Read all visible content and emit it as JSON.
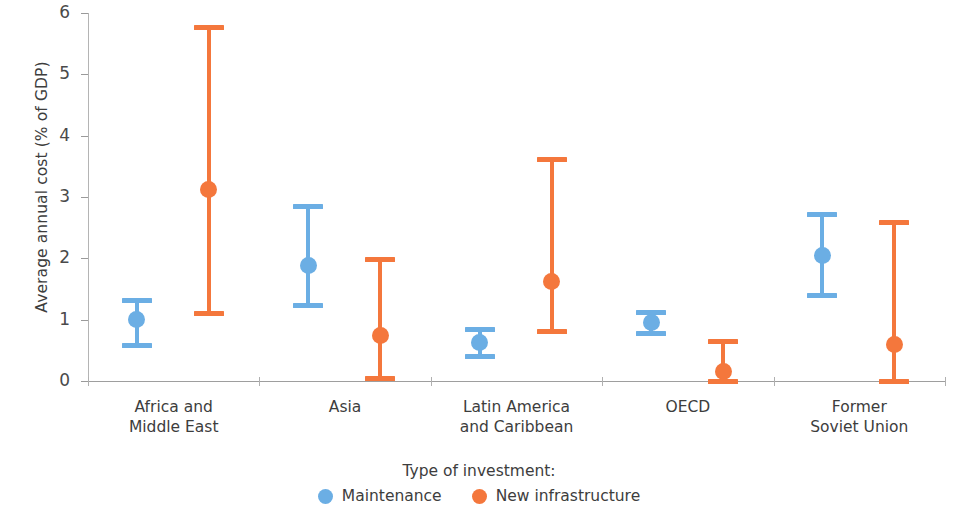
{
  "chart_data": {
    "type": "scatter",
    "title": "",
    "xlabel": "",
    "ylabel": "Average annual cost (% of GDP)",
    "ylim": [
      0,
      6
    ],
    "yticks": [
      0,
      1,
      2,
      3,
      4,
      5,
      6
    ],
    "ytick_labels": [
      "0",
      "1",
      "2",
      "3",
      "4",
      "5",
      "6"
    ],
    "grid": false,
    "legend_position": "bottom",
    "legend_title": "Type of investment:",
    "categories": [
      "Africa and\nMiddle East",
      "Asia",
      "Latin America\nand Caribbean",
      "OECD",
      "Former\nSoviet Union"
    ],
    "series": [
      {
        "name": "Maintenance",
        "color": "#6BAEE4",
        "values": [
          1.0,
          1.89,
          0.62,
          0.96,
          2.04
        ],
        "lower": [
          0.59,
          1.24,
          0.41,
          0.78,
          1.4
        ],
        "upper": [
          1.32,
          2.85,
          0.85,
          1.13,
          2.72
        ]
      },
      {
        "name": "New infrastructure",
        "color": "#F4773C",
        "values": [
          3.13,
          0.75,
          1.63,
          0.15,
          0.59
        ],
        "lower": [
          1.11,
          0.05,
          0.82,
          0.0,
          0.0
        ],
        "upper": [
          5.77,
          1.99,
          3.62,
          0.65,
          2.6
        ]
      }
    ]
  },
  "axis": {
    "y_title": "Average annual cost (% of GDP)",
    "y_labels": [
      "6",
      "5",
      "4",
      "3",
      "2",
      "1",
      "0"
    ]
  },
  "legend": {
    "title": "Type of investment:",
    "items": [
      {
        "label": "Maintenance",
        "color": "#6BAEE4"
      },
      {
        "label": "New infrastructure",
        "color": "#F4773C"
      }
    ]
  },
  "colors": {
    "maintenance": "#6BAEE4",
    "new_infrastructure": "#F4773C",
    "axis": "#9e9e9e",
    "text": "#3d3d3d"
  }
}
